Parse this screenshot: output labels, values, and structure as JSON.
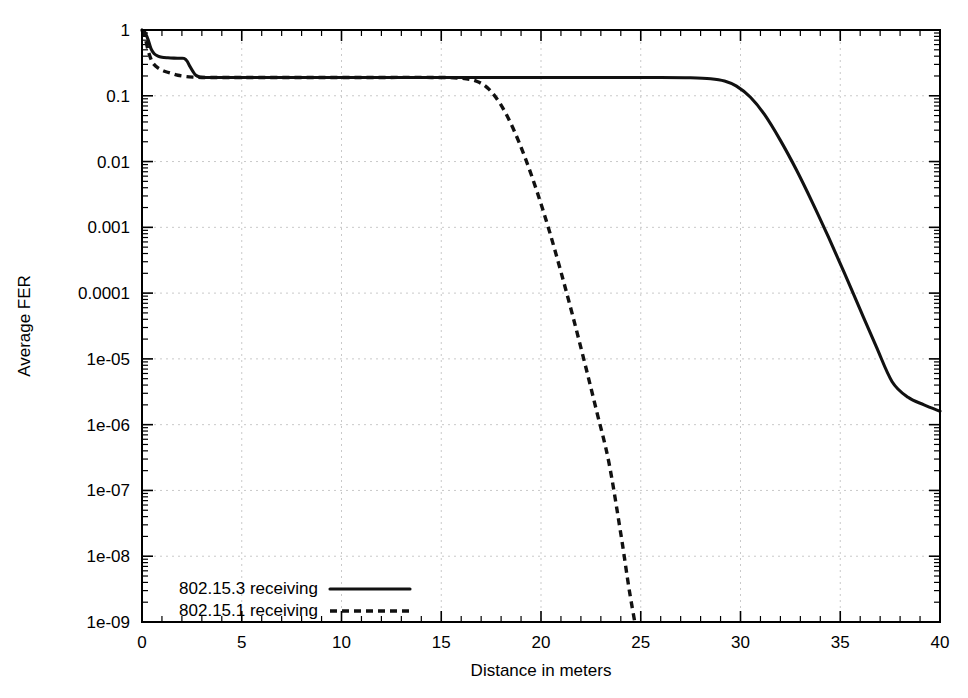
{
  "chart_data": {
    "type": "line",
    "title": "",
    "xlabel": "Distance in meters",
    "ylabel": "Average FER",
    "xlim": [
      0,
      40
    ],
    "ylim": [
      1e-09,
      1
    ],
    "yscale": "log",
    "xscale": "linear",
    "grid": true,
    "legend_position": "bottom-left",
    "xticks": [
      0,
      5,
      10,
      15,
      20,
      25,
      30,
      35,
      40
    ],
    "xtick_labels": [
      "0",
      "5",
      "10",
      "15",
      "20",
      "25",
      "30",
      "35",
      "40"
    ],
    "yticks": [
      1,
      0.1,
      0.01,
      0.001,
      0.0001,
      1e-05,
      1e-06,
      1e-07,
      1e-08,
      1e-09
    ],
    "ytick_labels": [
      "1",
      "0.1",
      "0.01",
      "0.001",
      "0.0001",
      "1e-05",
      "1e-06",
      "1e-07",
      "1e-08",
      "1e-09"
    ],
    "series": [
      {
        "name": "802.15.3 receiving",
        "style": "solid",
        "color": "#111111",
        "x": [
          0.0,
          0.15,
          0.3,
          0.45,
          0.6,
          0.8,
          1.0,
          1.3,
          1.6,
          1.9,
          2.1,
          2.25,
          2.4,
          2.55,
          2.7,
          2.9,
          3.2,
          4.0,
          6.0,
          9.0,
          12.0,
          15.0,
          18.0,
          21.0,
          24.0,
          26.0,
          27.5,
          28.5,
          29.2,
          29.8,
          30.5,
          31.2,
          32.0,
          32.8,
          33.6,
          34.4,
          35.2,
          36.0,
          36.8,
          37.6,
          38.4,
          39.2,
          40.0
        ],
        "y": [
          1.0,
          0.92,
          0.72,
          0.52,
          0.44,
          0.4,
          0.385,
          0.378,
          0.374,
          0.372,
          0.37,
          0.34,
          0.28,
          0.235,
          0.205,
          0.193,
          0.19,
          0.19,
          0.19,
          0.19,
          0.19,
          0.19,
          0.19,
          0.19,
          0.19,
          0.19,
          0.188,
          0.182,
          0.168,
          0.14,
          0.095,
          0.052,
          0.021,
          0.0075,
          0.0024,
          0.00072,
          0.000205,
          5.6e-05,
          1.55e-05,
          4.5e-06,
          2.6e-06,
          2e-06,
          1.6e-06
        ]
      },
      {
        "name": "802.15.1 receiving",
        "style": "dashed",
        "color": "#111111",
        "x": [
          0.0,
          0.15,
          0.3,
          0.45,
          0.6,
          0.8,
          1.0,
          1.2,
          1.5,
          1.8,
          2.2,
          2.6,
          3.0,
          4.0,
          6.0,
          9.0,
          12.0,
          14.5,
          16.0,
          16.8,
          17.4,
          18.0,
          18.6,
          19.2,
          19.8,
          20.4,
          21.0,
          21.6,
          22.2,
          22.8,
          23.4,
          24.0,
          24.4,
          24.7
        ],
        "y": [
          1.0,
          0.78,
          0.5,
          0.36,
          0.3,
          0.265,
          0.245,
          0.232,
          0.218,
          0.205,
          0.196,
          0.192,
          0.19,
          0.19,
          0.19,
          0.19,
          0.19,
          0.19,
          0.185,
          0.165,
          0.125,
          0.072,
          0.032,
          0.0115,
          0.0035,
          0.00092,
          0.00021,
          4.4e-05,
          8.5e-06,
          1.55e-06,
          2.7e-07,
          2.2e-08,
          3.4e-09,
          1e-09
        ]
      }
    ]
  },
  "legend": {
    "entries": [
      {
        "label": "802.15.3 receiving",
        "style": "solid"
      },
      {
        "label": "802.15.1 receiving",
        "style": "dashed"
      }
    ]
  },
  "axes": {
    "y_title": "Average FER",
    "x_title": "Distance in meters"
  }
}
